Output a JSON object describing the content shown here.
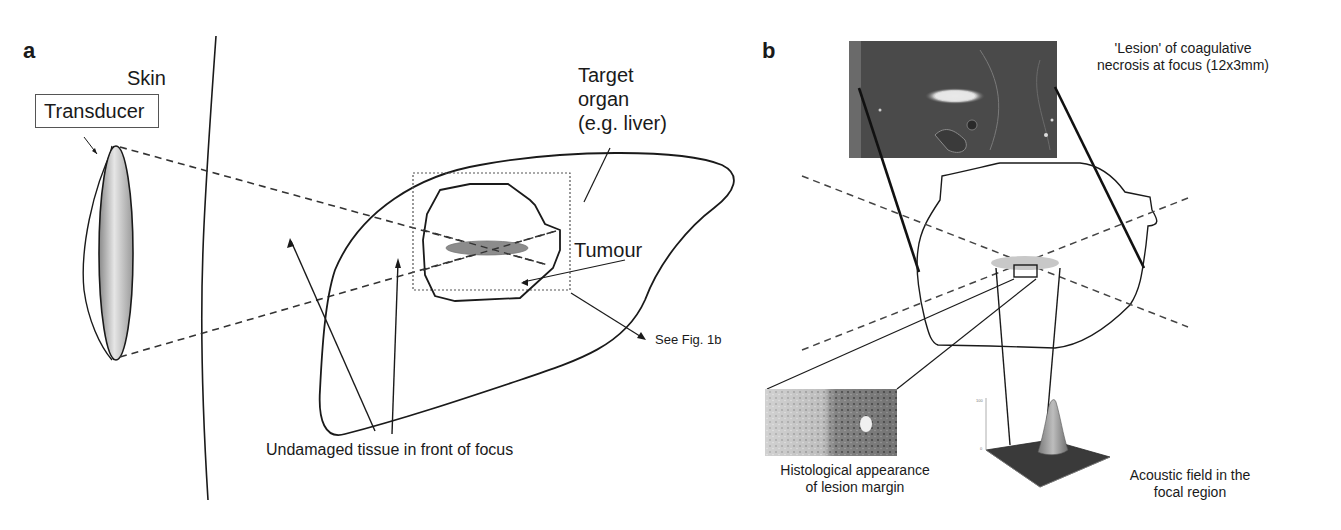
{
  "figure": {
    "panel_a": {
      "letter": "a",
      "labels": {
        "skin": "Skin",
        "transducer": "Transducer",
        "target_organ": [
          "Target",
          "organ",
          "(e.g. liver)"
        ],
        "tumour": "Tumour",
        "see_fig": "See Fig. 1b",
        "undamaged": "Undamaged tissue in front of focus"
      }
    },
    "panel_b": {
      "letter": "b",
      "labels": {
        "lesion": [
          "'Lesion' of coagulative",
          "necrosis at focus (12x3mm)"
        ],
        "histology": [
          "Histological appearance",
          "of lesion margin"
        ],
        "acoustic": [
          "Acoustic field in the",
          "focal region"
        ]
      }
    },
    "colors": {
      "line": "#1a1a1a",
      "focus_fill": "#8c8c8c",
      "photo_dark": "#4a4a4a",
      "focal_disc": "#c8c8c8"
    }
  }
}
